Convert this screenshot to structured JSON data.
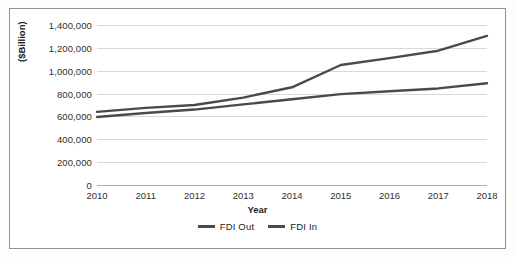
{
  "chart_data": {
    "type": "line",
    "title": "",
    "xlabel": "Year",
    "ylabel": "($Billion)",
    "categories": [
      "2010",
      "2011",
      "2012",
      "2013",
      "2014",
      "2015",
      "2016",
      "2017",
      "2018"
    ],
    "ylim": [
      0,
      1400000
    ],
    "ytick_step": 200000,
    "ytick_labels": [
      "1,400,000",
      "1,200,000",
      "1,000,000",
      "800,000",
      "600,000",
      "400,000",
      "200,000",
      "0"
    ],
    "ytick_values": [
      1400000,
      1200000,
      1000000,
      800000,
      600000,
      400000,
      200000,
      0
    ],
    "grid": true,
    "legend_position": "bottom",
    "series": [
      {
        "name": "FDI Out",
        "color": "#4a4a4a",
        "values": [
          640000,
          675000,
          700000,
          765000,
          855000,
          1050000,
          1110000,
          1175000,
          1305000
        ]
      },
      {
        "name": "FDI In",
        "color": "#4a4a4a",
        "values": [
          595000,
          630000,
          660000,
          705000,
          750000,
          795000,
          820000,
          845000,
          890000
        ]
      }
    ]
  },
  "legend": {
    "items": [
      {
        "label": "FDI Out"
      },
      {
        "label": "FDI In"
      }
    ]
  },
  "icons": {
    "legend_line": "line-swatch-icon"
  }
}
